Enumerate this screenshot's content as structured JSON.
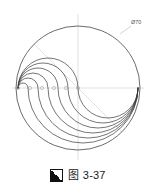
{
  "figure": {
    "caption_marker_icon": "black-white-diagonal-square-icon",
    "caption_text": "图 3-37",
    "background_color": "#ffffff",
    "line_color": "#3a3a3a",
    "construction_line_color": "#c9c9c9",
    "dimension_label": "Ø70"
  },
  "drawing": {
    "type": "technical-line-drawing",
    "description": "circle with nested S-shaped spiral arcs",
    "circle": {
      "cx": 78,
      "cy": 88,
      "r": 62
    },
    "center_marks": {
      "count": 6,
      "radius": 1.6,
      "y": 88,
      "x_positions": [
        18,
        30,
        42,
        54,
        66,
        78
      ]
    },
    "construction_lines": [
      {
        "name": "vertical-centerline",
        "x1": 78,
        "y1": 14,
        "x2": 78,
        "y2": 162
      },
      {
        "name": "horizontal-centerline",
        "x1": 12,
        "y1": 88,
        "x2": 144,
        "y2": 88
      },
      {
        "name": "diagonal-centerline",
        "x1": 34,
        "y1": 44,
        "x2": 122,
        "y2": 132
      }
    ],
    "arc_count": 6,
    "arc_radii": [
      10,
      20,
      30,
      40,
      50,
      60
    ],
    "symmetry": "180-degree rotational",
    "leader_line": {
      "x1": 120,
      "y1": 34,
      "x2": 131,
      "y2": 26
    }
  }
}
